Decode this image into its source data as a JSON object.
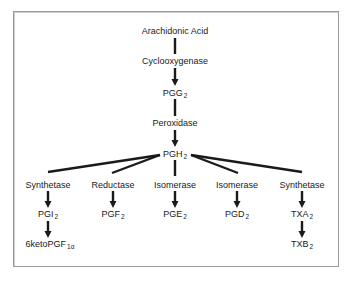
{
  "diagram": {
    "type": "biochemical-pathway",
    "colors": {
      "line": "#1a1a1a",
      "frame": "#9a9a9a",
      "background": "#ffffff"
    },
    "nodes": {
      "arachidonic_acid": {
        "label": "Arachidonic Acid"
      },
      "cyclooxygenase": {
        "label": "Cyclooxygenase"
      },
      "pgg2": {
        "base": "PGG",
        "sub": "2"
      },
      "peroxidase": {
        "label": "Peroxidase"
      },
      "pgh2": {
        "base": "PGH",
        "sub": "2"
      },
      "branches": [
        {
          "enzyme": "Synthetase",
          "product_base": "PGI",
          "product_sub": "2",
          "next_base": "6ketoPGF",
          "next_sub": "1α"
        },
        {
          "enzyme": "Reductase",
          "product_base": "PGF",
          "product_sub": "2"
        },
        {
          "enzyme": "Isomerase",
          "product_base": "PGE",
          "product_sub": "2"
        },
        {
          "enzyme": "Isomerase",
          "product_base": "PGD",
          "product_sub": "2"
        },
        {
          "enzyme": "Synthetase",
          "product_base": "TXA",
          "product_sub": "2",
          "next_base": "TXB",
          "next_sub": "2"
        }
      ]
    },
    "edges": [
      {
        "from": "Arachidonic Acid",
        "to": "Cyclooxygenase",
        "style": "line"
      },
      {
        "from": "Cyclooxygenase",
        "to": "PGG2",
        "style": "arrow"
      },
      {
        "from": "PGG2",
        "to": "Peroxidase",
        "style": "line"
      },
      {
        "from": "Peroxidase",
        "to": "PGH2",
        "style": "arrow"
      },
      {
        "from": "PGH2",
        "to": "Synthetase (PGI2)",
        "style": "line"
      },
      {
        "from": "PGH2",
        "to": "Reductase",
        "style": "line"
      },
      {
        "from": "PGH2",
        "to": "Isomerase (PGE2)",
        "style": "line"
      },
      {
        "from": "PGH2",
        "to": "Isomerase (PGD2)",
        "style": "line"
      },
      {
        "from": "PGH2",
        "to": "Synthetase (TXA2)",
        "style": "line"
      },
      {
        "from": "Synthetase",
        "to": "PGI2",
        "style": "arrow"
      },
      {
        "from": "Reductase",
        "to": "PGF2",
        "style": "arrow"
      },
      {
        "from": "Isomerase",
        "to": "PGE2",
        "style": "arrow"
      },
      {
        "from": "Isomerase",
        "to": "PGD2",
        "style": "arrow"
      },
      {
        "from": "Synthetase",
        "to": "TXA2",
        "style": "arrow"
      },
      {
        "from": "PGI2",
        "to": "6ketoPGF1α",
        "style": "arrow"
      },
      {
        "from": "TXA2",
        "to": "TXB2",
        "style": "arrow"
      }
    ]
  }
}
